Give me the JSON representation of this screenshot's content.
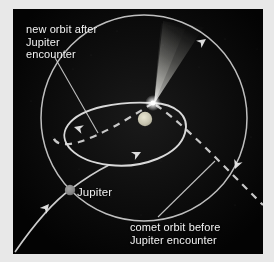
{
  "diagram": {
    "background_color": "#050505",
    "frame_color": "#e8e8e8",
    "line_color": "#d8d8d8",
    "labels": {
      "new_orbit": {
        "line1": "new orbit after",
        "line2": "Jupiter",
        "line3": "encounter"
      },
      "comet_orbit": {
        "line1": "comet orbit before",
        "line2": "Jupiter encounter"
      },
      "jupiter": "Jupiter"
    },
    "bodies": {
      "sun": {
        "name": "sun",
        "color": "#c9c6b4",
        "cx": 132,
        "cy": 110,
        "r": 7
      },
      "jupiter": {
        "name": "jupiter",
        "color": "#8a8a8a",
        "cx": 57,
        "cy": 181,
        "r": 5
      },
      "comet": {
        "name": "comet",
        "color": "#ffffff",
        "cx": 140,
        "cy": 94,
        "r": 3
      }
    },
    "orbits": {
      "outer_circle": {
        "name": "outer-orbit-circle",
        "cx": 131,
        "cy": 109,
        "r": 103,
        "style": "solid"
      },
      "new_ellipse": {
        "name": "new-orbit-ellipse",
        "style": "solid"
      },
      "old_ellipse": {
        "name": "old-orbit-dashed",
        "style": "dashed"
      },
      "hyperbolic_path": {
        "name": "comet-incoming-path",
        "style": "solid"
      }
    },
    "arrows": [
      {
        "name": "arrow-outer-top-right",
        "x": 192,
        "y": 31,
        "angle": -38
      },
      {
        "name": "arrow-outer-right",
        "x": 222,
        "y": 161,
        "angle": 118
      },
      {
        "name": "arrow-ellipse-left",
        "x": 62,
        "y": 118,
        "angle": 200
      },
      {
        "name": "arrow-ellipse-bottom",
        "x": 127,
        "y": 143,
        "angle": -28
      },
      {
        "name": "arrow-incoming-lower-left",
        "x": 35,
        "y": 196,
        "angle": -52
      }
    ]
  }
}
